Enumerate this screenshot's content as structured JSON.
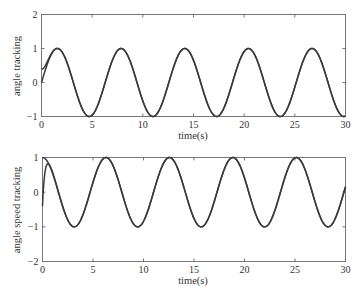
{
  "chart_data": [
    {
      "type": "line",
      "title": "",
      "xlabel": "time(s)",
      "ylabel": "angle  tracking",
      "xlim": [
        0,
        30
      ],
      "ylim": [
        -1,
        2
      ],
      "xticks": [
        0,
        5,
        10,
        15,
        20,
        25,
        30
      ],
      "yticks": [
        -1,
        0,
        1,
        2
      ],
      "grid": false,
      "series": [
        {
          "name": "reference",
          "function": "sin(t)",
          "x_start": 0,
          "y_start": 0.0,
          "peaks_x": [
            1.57,
            7.85,
            14.14,
            20.42,
            26.7
          ],
          "troughs_x": [
            4.71,
            11.0,
            17.28,
            23.56,
            29.85
          ]
        },
        {
          "name": "tracking",
          "function": "sin(t) with initial offset",
          "x_start": 0,
          "y_start": 0.4,
          "note": "converges to reference within ~1 s"
        }
      ]
    },
    {
      "type": "line",
      "title": "",
      "xlabel": "time(s)",
      "ylabel": "angle speed tracking",
      "xlim": [
        0,
        30
      ],
      "ylim": [
        -2,
        1
      ],
      "xticks": [
        0,
        5,
        10,
        15,
        20,
        25,
        30
      ],
      "yticks": [
        -2,
        -1,
        0,
        1
      ],
      "grid": false,
      "series": [
        {
          "name": "reference",
          "function": "cos(t)",
          "x_start": 0,
          "y_start": 1.0,
          "peaks_x": [
            0,
            6.28,
            12.57,
            18.85,
            25.13
          ],
          "troughs_x": [
            3.14,
            9.42,
            15.71,
            21.99,
            28.27
          ]
        },
        {
          "name": "tracking",
          "function": "cos(t) with initial transient",
          "x_start": 0,
          "y_start": -0.4,
          "transient_peak": {
            "x": 0.5,
            "y": 0.7
          },
          "note": "converges to reference within ~1.5 s"
        }
      ]
    }
  ],
  "plots": {
    "top": {
      "ylabel": "angle  tracking",
      "xlabel": "time(s)",
      "xtick_labels": [
        "0",
        "5",
        "10",
        "15",
        "20",
        "25",
        "30"
      ],
      "ytick_labels": [
        "−1",
        "0",
        "1",
        "2"
      ]
    },
    "bottom": {
      "ylabel": "angle speed tracking",
      "xlabel": "time(s)",
      "xtick_labels": [
        "0",
        "5",
        "10",
        "15",
        "20",
        "25",
        "30"
      ],
      "ytick_labels": [
        "−2",
        "−1",
        "0",
        "1"
      ]
    }
  },
  "colors": {
    "line": "#3a3a3a",
    "axis": "#666666",
    "background": "#ffffff"
  }
}
